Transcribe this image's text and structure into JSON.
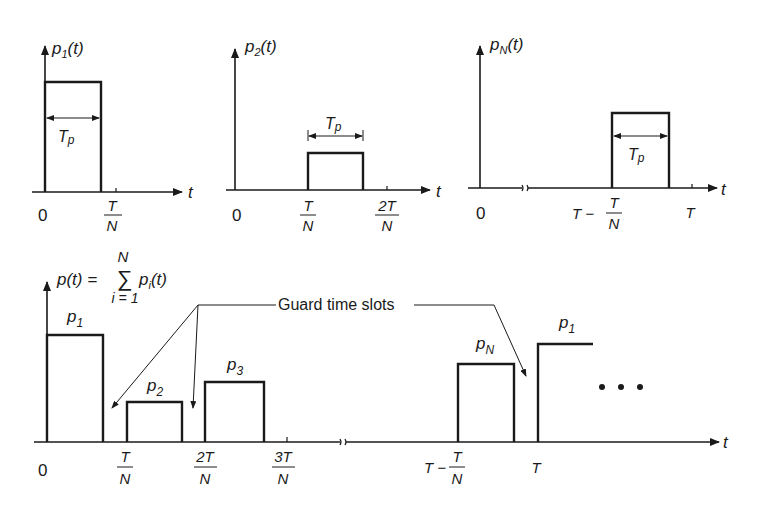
{
  "figure": {
    "panels": {
      "p1": {
        "ylabel": "p",
        "ylabel_sub": "1",
        "ylabel_arg": "(t)",
        "xlabel": "t",
        "origin": "0",
        "tick1_num": "T",
        "tick1_den": "N",
        "width_label": "T",
        "width_label_sub": "p"
      },
      "p2": {
        "ylabel": "p",
        "ylabel_sub": "2",
        "ylabel_arg": "(t)",
        "xlabel": "t",
        "origin": "0",
        "tick1_num": "T",
        "tick1_den": "N",
        "tick2_num": "2T",
        "tick2_den": "N",
        "width_label": "T",
        "width_label_sub": "p"
      },
      "pN": {
        "ylabel": "p",
        "ylabel_sub": "N",
        "ylabel_arg": "(t)",
        "xlabel": "t",
        "origin": "0",
        "tick1_prefix": "T −",
        "tick1_num": "T",
        "tick1_den": "N",
        "tick2": "T",
        "width_label": "T",
        "width_label_sub": "p"
      }
    },
    "combined": {
      "formula_lhs": "p(t) =",
      "sum_symbol": "∑",
      "sum_upper": "N",
      "sum_lower": "i = 1",
      "formula_rhs": "p",
      "formula_rhs_sub": "i",
      "formula_rhs_arg": "(t)",
      "xlabel": "t",
      "origin": "0",
      "ticks": [
        {
          "num": "T",
          "den": "N"
        },
        {
          "num": "2T",
          "den": "N"
        },
        {
          "num": "3T",
          "den": "N"
        }
      ],
      "tick_tn_prefix": "T −",
      "tick_tn_num": "T",
      "tick_tn_den": "N",
      "tick_T": "T",
      "pulses": [
        {
          "label": "p",
          "sub": "1"
        },
        {
          "label": "p",
          "sub": "2"
        },
        {
          "label": "p",
          "sub": "3"
        },
        {
          "label": "p",
          "sub": "N"
        },
        {
          "label": "p",
          "sub": "1"
        }
      ],
      "annotation": "Guard time slots",
      "ellipsis": "• • •"
    }
  }
}
